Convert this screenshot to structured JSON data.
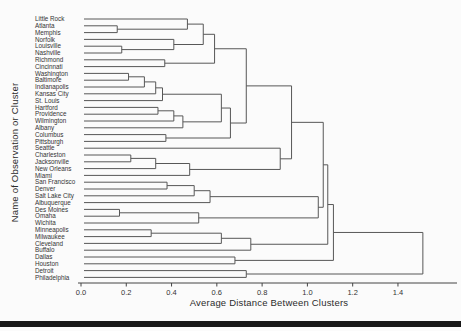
{
  "figure": {
    "background": "#fbfbfb",
    "line_color": "#575757",
    "label_color": "#333333",
    "axis_color": "#444444",
    "bottom_rule_color": "#181818"
  },
  "chart_data": {
    "type": "dendrogram",
    "orientation": "horizontal",
    "title": "",
    "xlabel": "Average Distance Between Clusters",
    "ylabel": "Name of Observation or Cluster",
    "x_ticks": [
      {
        "label": "0.0",
        "value": 0.0
      },
      {
        "label": "0.2",
        "value": 0.2
      },
      {
        "label": "0.4",
        "value": 0.4
      },
      {
        "label": "0.6",
        "value": 0.6
      },
      {
        "label": "0.8",
        "value": 0.8
      },
      {
        "label": "1.0",
        "value": 1.0
      },
      {
        "label": "1.2",
        "value": 1.2
      },
      {
        "label": "1.4",
        "value": 1.4
      }
    ],
    "xlim": [
      0.0,
      1.55
    ],
    "grid": false,
    "legend": "none",
    "leaves": [
      "Little Rock",
      "Atlanta",
      "Memphis",
      "Norfolk",
      "Louisville",
      "Nashville",
      "Richmond",
      "Cincinnati",
      "Washington",
      "Baltimore",
      "Indianapolis",
      "Kansas City",
      "St. Louis",
      "Hartford",
      "Providence",
      "Wilmington",
      "Albany",
      "Columbus",
      "Pittsburgh",
      "Seattle",
      "Charleston",
      "Jacksonville",
      "New Orleans",
      "Miami",
      "San Francisco",
      "Denver",
      "Salt Lake City",
      "Albuquerque",
      "Des Moines",
      "Omaha",
      "Wichita",
      "Minneapolis",
      "Milwaukee",
      "Cleveland",
      "Buffalo",
      "Dallas",
      "Houston",
      "Detroit",
      "Philadelphia"
    ],
    "merges": [
      [
        1,
        2,
        0.16
      ],
      [
        0,
        "m0",
        0.47
      ],
      [
        4,
        5,
        0.18
      ],
      [
        3,
        "m2",
        0.41
      ],
      [
        "m1",
        "m3",
        0.54
      ],
      [
        6,
        7,
        0.37
      ],
      [
        "m4",
        "m5",
        0.59
      ],
      [
        8,
        9,
        0.21
      ],
      [
        "m7",
        10,
        0.28
      ],
      [
        "m8",
        11,
        0.33
      ],
      [
        "m9",
        12,
        0.36
      ],
      [
        13,
        14,
        0.34
      ],
      [
        "m11",
        15,
        0.41
      ],
      [
        "m12",
        16,
        0.45
      ],
      [
        "m10",
        "m13",
        0.62
      ],
      [
        17,
        18,
        0.375
      ],
      [
        "m14",
        "m15",
        0.66
      ],
      [
        "m6",
        "m16",
        0.73
      ],
      [
        20,
        21,
        0.22
      ],
      [
        "m18",
        22,
        0.33
      ],
      [
        "m19",
        23,
        0.48
      ],
      [
        19,
        "m20",
        0.88
      ],
      [
        "m17",
        "m21",
        0.93
      ],
      [
        24,
        25,
        0.38
      ],
      [
        "m23",
        26,
        0.5
      ],
      [
        "m24",
        27,
        0.57
      ],
      [
        28,
        29,
        0.17
      ],
      [
        "m26",
        30,
        0.52
      ],
      [
        "m25",
        "m27",
        1.048
      ],
      [
        "m22",
        "m28",
        1.07
      ],
      [
        31,
        32,
        0.31
      ],
      [
        "m30",
        33,
        0.62
      ],
      [
        "m31",
        34,
        0.75
      ],
      [
        "m29",
        "m32",
        1.09
      ],
      [
        35,
        36,
        0.68
      ],
      [
        "m33",
        "m34",
        1.115
      ],
      [
        37,
        38,
        0.73
      ],
      [
        "m35",
        "m36",
        1.51
      ]
    ]
  }
}
